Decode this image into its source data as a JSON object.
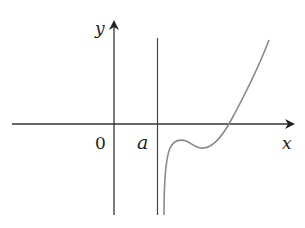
{
  "diagram": {
    "type": "function-graph",
    "axes": {
      "x_label": "x",
      "y_label": "y",
      "origin_label": "0"
    },
    "asymptote": {
      "label": "a",
      "orientation": "vertical"
    },
    "colors": {
      "axis": "#333333",
      "curve": "#8a8a8a",
      "text": "#222222"
    }
  }
}
